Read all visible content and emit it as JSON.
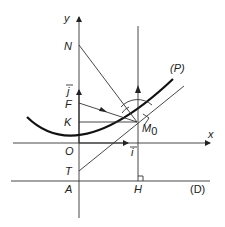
{
  "diagram": {
    "labels": {
      "y_axis": "y",
      "x_axis": "x",
      "N": "N",
      "j_vec": "j",
      "F": "F",
      "K": "K",
      "O": "O",
      "T": "T",
      "A": "A",
      "H": "H",
      "M0": "M",
      "M0_sub": "0",
      "i_vec": "i",
      "P": "(P)",
      "D": "(D)"
    },
    "colors": {
      "ink": "#222222",
      "curve": "#111111"
    }
  }
}
